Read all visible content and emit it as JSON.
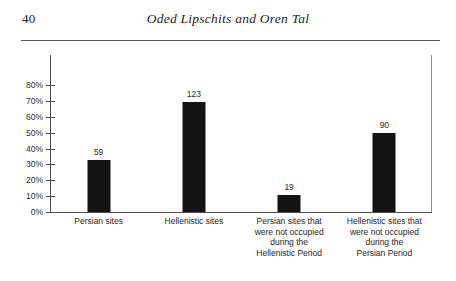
{
  "page": {
    "folio": "40",
    "running_title": "Oded Lipschits and Oren Tal"
  },
  "chart_data": {
    "type": "bar",
    "title": "",
    "xlabel": "",
    "ylabel": "",
    "ylim": [
      0,
      80
    ],
    "grid": false,
    "legend": null,
    "tick_labels": [
      "0%",
      "10%",
      "20%",
      "30%",
      "40%",
      "50%",
      "60%",
      "70%",
      "80%"
    ],
    "tick_values": [
      0,
      10,
      20,
      30,
      40,
      50,
      60,
      70,
      80
    ],
    "categories": [
      "Persian sites",
      "Hellenistic sites",
      "Persian sites that were not occupied during the Hellenistic Period",
      "Hellenistic sites that were not occupied during the Persian Period"
    ],
    "category_lines": [
      [
        "Persian sites"
      ],
      [
        "Hellenistic sites"
      ],
      [
        "Persian sites that",
        "were not occupied",
        "during the",
        "Hellenistic Period"
      ],
      [
        "Hellenistic sites that",
        "were not occupied",
        "during the",
        "Persian Period"
      ]
    ],
    "values": [
      33,
      69,
      10.7,
      50
    ],
    "data_labels": [
      "59",
      "123",
      "19",
      "90"
    ],
    "counts": [
      59,
      123,
      19,
      90
    ],
    "bar_color": "#131313",
    "axis_color": "#4d4d4d"
  }
}
